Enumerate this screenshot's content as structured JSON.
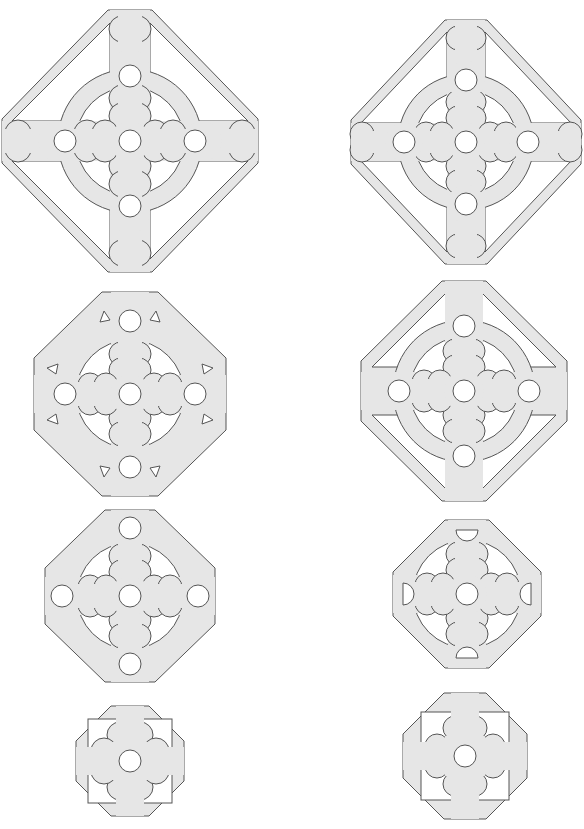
{
  "figure": {
    "background": "#ffffff",
    "fill_color": "#e6e6e6",
    "stroke_color": "#555555"
  },
  "shapes": [
    {
      "id": 1,
      "position": "row1-left",
      "center": [
        130,
        141
      ],
      "size": [
        256,
        262
      ],
      "features": [
        "outer octagon frame",
        "ring",
        "cross of lobes",
        "5 circular holes"
      ]
    },
    {
      "id": 2,
      "position": "row1-right",
      "center": [
        466,
        142
      ],
      "size": [
        230,
        245
      ],
      "features": [
        "outer octagon frame",
        "ring",
        "cross of lobes",
        "5 circular holes"
      ]
    },
    {
      "id": 3,
      "position": "row2-left",
      "center": [
        130,
        394
      ],
      "size": [
        192,
        204
      ],
      "features": [
        "octagon",
        "ring",
        "small corner slits",
        "5 circular holes"
      ]
    },
    {
      "id": 4,
      "position": "row2-right",
      "center": [
        464,
        391
      ],
      "size": [
        206,
        220
      ],
      "features": [
        "outer octagon frame",
        "ring",
        "5 circular holes"
      ]
    },
    {
      "id": 5,
      "position": "row3-left",
      "center": [
        130,
        596
      ],
      "size": [
        170,
        172
      ],
      "features": [
        "octagon",
        "ring",
        "5 circular holes"
      ]
    },
    {
      "id": 6,
      "position": "row3-right",
      "center": [
        467,
        594
      ],
      "size": [
        148,
        148
      ],
      "features": [
        "octagon",
        "ring",
        "4 half-moon holes",
        "1 center hole"
      ]
    },
    {
      "id": 7,
      "position": "row4-left",
      "center": [
        130,
        761
      ],
      "size": [
        108,
        110
      ],
      "features": [
        "octagon",
        "lobed cross",
        "1 center hole"
      ]
    },
    {
      "id": 8,
      "position": "row4-right",
      "center": [
        465,
        756
      ],
      "size": [
        124,
        126
      ],
      "features": [
        "octagon",
        "lobed cross",
        "1 center hole"
      ]
    }
  ]
}
